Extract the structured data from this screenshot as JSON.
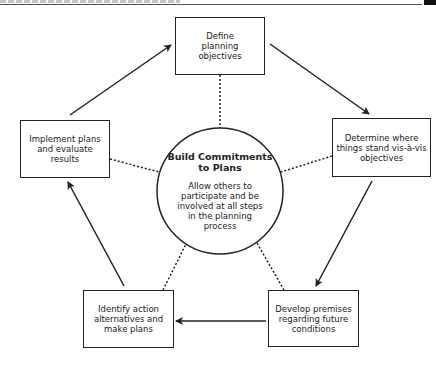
{
  "header": {
    "text_illegible": true
  },
  "diagram": {
    "title": "",
    "center": {
      "title": "Build Commitments to Plans",
      "body": "Allow others to participate and be involved at all steps in the planning process"
    },
    "steps": [
      {
        "id": "define",
        "label": "Define planning objectives"
      },
      {
        "id": "determine",
        "label": "Determine where things stand vis-à-vis objectives"
      },
      {
        "id": "develop",
        "label": "Develop premises regarding future conditions"
      },
      {
        "id": "identify",
        "label": "Identify action alternatives and make plans"
      },
      {
        "id": "implement",
        "label": "Implement plans and evaluate results"
      }
    ],
    "flow": [
      {
        "from": "define",
        "to": "determine"
      },
      {
        "from": "determine",
        "to": "develop"
      },
      {
        "from": "develop",
        "to": "identify"
      },
      {
        "from": "identify",
        "to": "implement"
      },
      {
        "from": "implement",
        "to": "define"
      }
    ],
    "colors": {
      "line": "#222222",
      "background": "#ffffff"
    }
  }
}
